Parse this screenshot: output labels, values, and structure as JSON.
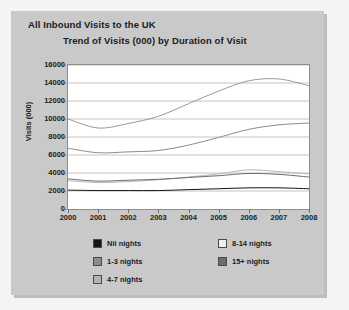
{
  "panel": {
    "main_title": "All Inbound Visits to the UK",
    "sub_title": "Trend of Visits (000) by Duration of Visit"
  },
  "colors": {
    "page_background": "#f4f4f4",
    "panel_background": "#c9c9c9",
    "plot_background": "#ffffff",
    "plot_border": "#8e8e8e",
    "gridline": "#c4c4c4",
    "text": "#1b1b1b",
    "series_nil_nights": "#141414",
    "series_1_3_nights": "#8c8c8c",
    "series_4_7_nights": "#b4b4b4",
    "series_8_14_nights": "#efefef",
    "series_15_plus_nights": "#6d6d6d"
  },
  "legend": {
    "items": [
      {
        "label": "Nil nights",
        "swatch": "#141414"
      },
      {
        "label": "1-3 nights",
        "swatch": "#8c8c8c"
      },
      {
        "label": "4-7 nights",
        "swatch": "#b4b4b4"
      },
      {
        "label": "8-14 nights",
        "swatch": "#efefef"
      },
      {
        "label": "15+ nights",
        "swatch": "#6d6d6d"
      }
    ]
  },
  "chart_data": {
    "type": "line",
    "title": "Trend of Visits (000) by Duration of Visit",
    "xlabel": "",
    "ylabel": "Visits (000)",
    "x": [
      2000,
      2001,
      2002,
      2003,
      2004,
      2005,
      2006,
      2007,
      2008
    ],
    "xticklabels": [
      "2000",
      "2001",
      "2002",
      "2003",
      "2004",
      "2005",
      "2006",
      "2007",
      "2008"
    ],
    "ylim": [
      0,
      16000
    ],
    "yticks": [
      0,
      2000,
      4000,
      6000,
      8000,
      10000,
      12000,
      14000,
      16000
    ],
    "yticklabels": [
      "0",
      "2000",
      "4000",
      "6000",
      "8000",
      "10000",
      "12000",
      "14000",
      "16000"
    ],
    "grid": true,
    "legend_position": "bottom",
    "series": [
      {
        "name": "Nil nights",
        "values": [
          2100,
          2050,
          2050,
          2050,
          2150,
          2250,
          2350,
          2350,
          2250
        ]
      },
      {
        "name": "1-3 nights",
        "values": [
          6750,
          6250,
          6350,
          6500,
          7100,
          7950,
          8850,
          9350,
          9550
        ]
      },
      {
        "name": "4-7 nights",
        "values": [
          3150,
          2950,
          3050,
          3250,
          3550,
          3900,
          4350,
          4150,
          3900
        ]
      },
      {
        "name": "8-14 nights",
        "values": [
          10000,
          9000,
          9500,
          10300,
          11700,
          13100,
          14250,
          14450,
          13700
        ]
      },
      {
        "name": "15+ nights",
        "values": [
          3350,
          3100,
          3200,
          3300,
          3500,
          3700,
          3950,
          3850,
          3550
        ]
      }
    ]
  }
}
